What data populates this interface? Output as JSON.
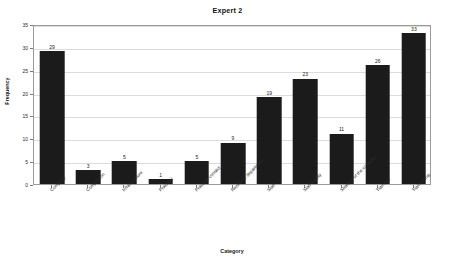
{
  "chart_data": {
    "type": "bar",
    "title": "Expert 2",
    "xlabel": "Category",
    "ylabel": "Frequency",
    "ylim": [
      0,
      35
    ],
    "ytick_step": 5,
    "yticks": [
      0,
      5,
      10,
      15,
      20,
      25,
      30,
      35
    ],
    "grid": true,
    "legend": null,
    "bar_color": "#1b1b1b",
    "categories": [
      "Company",
      "Competition",
      "Infrastructure",
      "Practical",
      "Practical contact",
      "Research department",
      "Staff",
      "Staff quality",
      "Strategy of the company",
      "Trainees",
      "Traineeship"
    ],
    "values": [
      29,
      3,
      5,
      1,
      5,
      9,
      19,
      23,
      11,
      26,
      33
    ],
    "value_labels": [
      "29",
      "3",
      "5",
      "1",
      "5",
      "9",
      "19",
      "23",
      "11",
      "26",
      "33"
    ]
  }
}
